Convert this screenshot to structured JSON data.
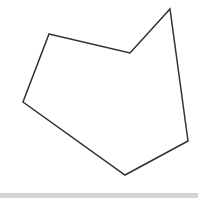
{
  "diagram": {
    "shape": "polygon",
    "stroke_color": "#333333",
    "fill_color": "none",
    "stroke_width": 1.5,
    "vertices": [
      [
        49,
        34
      ],
      [
        130,
        53
      ],
      [
        170,
        9
      ],
      [
        188,
        141
      ],
      [
        125,
        175
      ],
      [
        23,
        102
      ]
    ]
  },
  "footer_band": {
    "color": "#d4d4d4"
  }
}
